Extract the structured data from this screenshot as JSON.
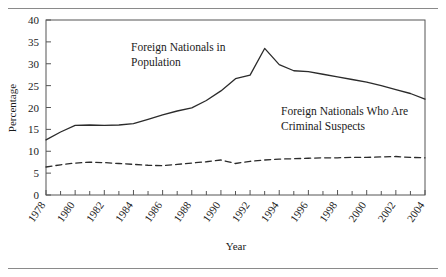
{
  "chart_data": {
    "type": "line",
    "title": "",
    "xlabel": "Year",
    "ylabel": "Percentage",
    "ylim": [
      0,
      40
    ],
    "xlim": [
      1978,
      2004
    ],
    "yticks": [
      0,
      5,
      10,
      15,
      20,
      25,
      30,
      35,
      40
    ],
    "xticks": [
      1978,
      1980,
      1982,
      1984,
      1986,
      1988,
      1990,
      1992,
      1994,
      1996,
      1998,
      2000,
      2002,
      2004
    ],
    "xtick_labels": [
      "1978",
      "1980",
      "1982",
      "1984",
      "1986",
      "1988",
      "1990",
      "1992",
      "1994",
      "1996",
      "1998",
      "2000",
      "2002",
      "2004"
    ],
    "minor_xticks_every": 1,
    "grid": false,
    "legend_position": "inline-annotations",
    "x": [
      1978,
      1979,
      1980,
      1981,
      1982,
      1983,
      1984,
      1985,
      1986,
      1987,
      1988,
      1989,
      1990,
      1991,
      1992,
      1993,
      1994,
      1995,
      1996,
      1997,
      1998,
      1999,
      2000,
      2001,
      2002,
      2003,
      2004
    ],
    "series": [
      {
        "name": "Foreign Nationals in Population",
        "style": "solid",
        "color": "#2b2b2b",
        "label_line1": "Foreign Nationals in",
        "label_line2": "Population",
        "values": [
          12.6,
          14.4,
          15.9,
          16.0,
          15.9,
          16.0,
          16.3,
          17.3,
          18.3,
          19.2,
          19.9,
          21.6,
          23.8,
          26.6,
          27.4,
          33.5,
          29.8,
          28.4,
          28.2,
          27.6,
          27.0,
          26.4,
          25.8,
          25.0,
          24.1,
          23.2,
          21.9
        ]
      },
      {
        "name": "Foreign Nationals Who Are Criminal Suspects",
        "style": "dashed",
        "color": "#2b2b2b",
        "label_line1": "Foreign Nationals Who Are",
        "label_line2": "Criminal Suspects",
        "values": [
          6.4,
          6.9,
          7.3,
          7.5,
          7.4,
          7.2,
          7.0,
          6.8,
          6.7,
          7.0,
          7.3,
          7.6,
          8.0,
          7.2,
          7.7,
          8.0,
          8.2,
          8.3,
          8.4,
          8.5,
          8.5,
          8.6,
          8.6,
          8.7,
          8.8,
          8.6,
          8.5
        ]
      }
    ]
  },
  "annotations": {
    "series1_label_line1": "Foreign Nationals in",
    "series1_label_line2": "Population",
    "series2_label_line1": "Foreign Nationals Who Are",
    "series2_label_line2": "Criminal Suspects"
  },
  "axes": {
    "y_title": "Percentage",
    "x_title": "Year"
  }
}
